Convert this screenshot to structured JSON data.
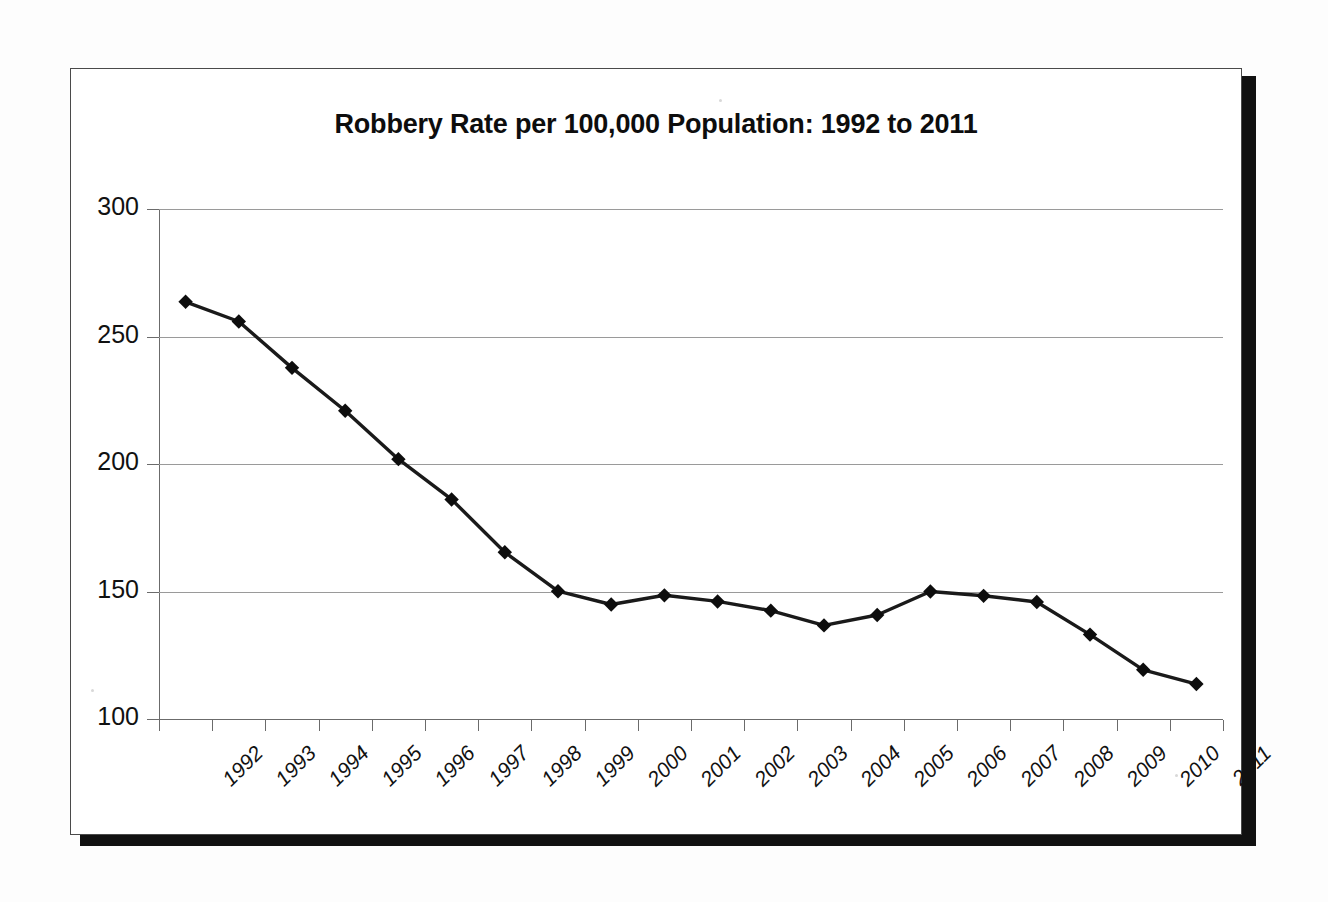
{
  "chart_data": {
    "type": "line",
    "title": "Robbery Rate per 100,000 Population: 1992 to 2011",
    "xlabel": "",
    "ylabel": "",
    "categories": [
      "1992",
      "1993",
      "1994",
      "1995",
      "1996",
      "1997",
      "1998",
      "1999",
      "2000",
      "2001",
      "2002",
      "2003",
      "2004",
      "2005",
      "2006",
      "2007",
      "2008",
      "2009",
      "2010",
      "2011"
    ],
    "values": [
      263.6,
      255.9,
      237.7,
      220.9,
      201.9,
      186.1,
      165.4,
      150.1,
      144.9,
      148.5,
      146.1,
      142.5,
      136.7,
      140.8,
      150.0,
      148.3,
      145.9,
      133.1,
      119.3,
      113.7
    ],
    "series": [
      {
        "name": "Robbery rate",
        "values": [
          263.6,
          255.9,
          237.7,
          220.9,
          201.9,
          186.1,
          165.4,
          150.1,
          144.9,
          148.5,
          146.1,
          142.5,
          136.7,
          140.8,
          150.0,
          148.3,
          145.9,
          133.1,
          119.3,
          113.7
        ]
      }
    ],
    "ylim": [
      100,
      300
    ],
    "y_ticks": [
      "100",
      "150",
      "200",
      "250",
      "300"
    ],
    "y_tick_values": [
      100,
      150,
      200,
      250,
      300
    ],
    "grid": true,
    "legend": "none",
    "marker": "diamond",
    "line_color": "#1a1a1a",
    "marker_color": "#0d0d0d",
    "grid_color": "#9a9a9a",
    "axis_color": "#6b6b6b",
    "background": "#ffffff"
  },
  "frame": {
    "border_color": "#4a4a4a",
    "shadow_color": "#111111"
  }
}
